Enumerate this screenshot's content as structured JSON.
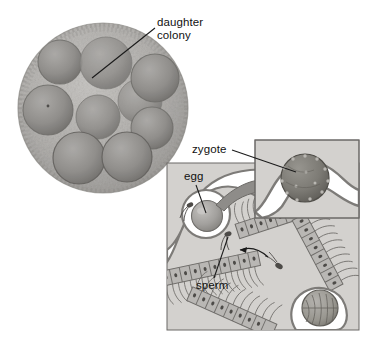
{
  "figure": {
    "background_color": "#ffffff",
    "text_color": "#111111"
  },
  "photomicrograph": {
    "name": "volvox-colony-photomicrograph",
    "center": {
      "x": 103,
      "y": 108
    },
    "radius": 85,
    "colors": {
      "body": "#b2b0ad",
      "rim": "#9a9895",
      "daughter": "#8e8c89",
      "daughter_dark": "#6f6d6b"
    },
    "daughter_colony_count": 9,
    "daughter_colonies": [
      {
        "cx": 60,
        "cy": 62,
        "r": 22
      },
      {
        "cx": 106,
        "cy": 63,
        "r": 26
      },
      {
        "cx": 48,
        "cy": 110,
        "r": 25
      },
      {
        "cx": 98,
        "cy": 117,
        "r": 22
      },
      {
        "cx": 145,
        "cy": 100,
        "r": 22
      },
      {
        "cx": 153,
        "cy": 77,
        "r": 24
      },
      {
        "cx": 150,
        "cy": 128,
        "r": 20
      },
      {
        "cx": 79,
        "cy": 158,
        "r": 25
      },
      {
        "cx": 126,
        "cy": 157,
        "r": 24
      }
    ],
    "callout": {
      "label_line1": "daughter",
      "label_line2": "colony",
      "leader_from": {
        "x": 155,
        "y": 28
      },
      "leader_to": {
        "x": 92,
        "y": 78
      }
    }
  },
  "labels": {
    "daughter_colony": "daughter\ncolony",
    "zygote": "zygote",
    "egg": "egg",
    "sperm": "sperm"
  },
  "diagram": {
    "name": "sexual-reproduction-diagram",
    "main_panel": {
      "x": 167,
      "y": 163,
      "width": 192,
      "height": 167,
      "fill": "#d2d0cd",
      "border": "#6b6966"
    },
    "inset_panel": {
      "x": 255,
      "y": 140,
      "width": 104,
      "height": 78,
      "fill": "#d2d0cd",
      "border": "#6b6966"
    },
    "colors": {
      "membrane": "#7d7b78",
      "lumen": "#ffffff",
      "cell_fill": "#b9b7b4",
      "egg_fill": "#9d9b98",
      "zygote_fill": "#77756f",
      "arrow_fill": "#8e8c89"
    },
    "elements": [
      {
        "name": "egg-cell",
        "label": "egg"
      },
      {
        "name": "zygote-cell",
        "label": "zygote"
      },
      {
        "name": "sperm-cell",
        "label": "sperm"
      },
      {
        "name": "sperm-packet",
        "label": ""
      },
      {
        "name": "somatic-cell-rows",
        "label": ""
      },
      {
        "name": "fertilization-arrow",
        "label": ""
      },
      {
        "name": "magnify-arrow",
        "label": ""
      }
    ],
    "leaders": {
      "zygote": {
        "from": {
          "x": 232,
          "y": 150
        },
        "to": {
          "x": 288,
          "y": 170
        }
      },
      "egg": {
        "from": {
          "x": 196,
          "y": 184
        },
        "to": {
          "x": 206,
          "y": 212
        }
      },
      "sperm": {
        "from": {
          "x": 215,
          "y": 278
        },
        "to": {
          "x": 228,
          "y": 238
        }
      }
    }
  }
}
